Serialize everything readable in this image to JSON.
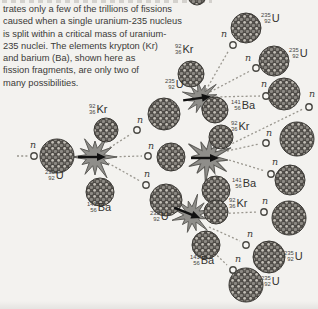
{
  "caption": {
    "lines": [
      "trates only a few of the trillions of fissions",
      "caused when a single uranium-235 nucleus",
      "is split within a critical mass of uranium-",
      "235 nuclei. The elements krypton (Kr)",
      "and barium (Ba), shown here as",
      "fission fragments, are only two of",
      "many possibilities."
    ]
  },
  "isotopes": {
    "u235": {
      "mass": "235",
      "number": "92",
      "symbol": "U"
    },
    "kr92": {
      "mass": "92",
      "number": "36",
      "symbol": "Kr"
    },
    "ba141": {
      "mass": "141",
      "number": "56",
      "symbol": "Ba"
    }
  },
  "neutron": {
    "symbol": "n"
  },
  "colors": {
    "background": "#f3f2ef",
    "text": "#3b3a38",
    "nucleus_base": "#4b4844",
    "nucleus_speckle": "#c2beb6",
    "explosion_fill": "#8f8e8a",
    "explosion_outline": "#5c5b57",
    "neutron_path": "#9a978f",
    "arrow": "#111111"
  }
}
